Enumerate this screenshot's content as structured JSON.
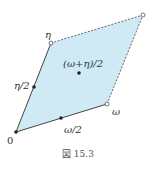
{
  "figure": {
    "caption": "図 15.3",
    "fill_color": "#cfe9f5",
    "stroke_color": "#444444",
    "labels": {
      "origin": "0",
      "omega": "ω",
      "eta": "η",
      "omega_half": "ω/2",
      "eta_half": "η/2",
      "center": "(ω+η)/2"
    },
    "points": {
      "origin": [
        16,
        132
      ],
      "omega": [
        107,
        104
      ],
      "omega_plus_eta": [
        143,
        15
      ],
      "eta": [
        51,
        43
      ],
      "omega_half": [
        61,
        118
      ],
      "eta_half": [
        34,
        87
      ],
      "center": [
        79,
        73
      ]
    }
  }
}
